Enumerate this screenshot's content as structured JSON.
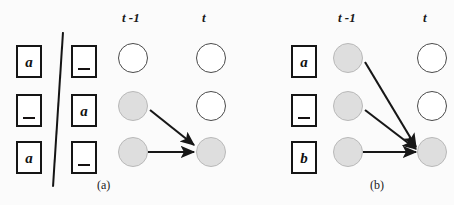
{
  "figure": {
    "type": "diagram",
    "panels": [
      {
        "id": "a",
        "caption": "(a)",
        "column_headers": {
          "previous": "t -1",
          "current": "t"
        },
        "tape": {
          "left_column": [
            {
              "glyph": "a",
              "blank": false
            },
            {
              "glyph": "",
              "blank": true
            },
            {
              "glyph": "a",
              "blank": false
            }
          ],
          "right_column": [
            {
              "glyph": "",
              "blank": true
            },
            {
              "glyph": "a",
              "blank": false
            },
            {
              "glyph": "",
              "blank": true
            }
          ],
          "divider": "slanted-line"
        },
        "nodes": {
          "previous_column": [
            {
              "row": 1,
              "state": "empty"
            },
            {
              "row": 2,
              "state": "filled"
            },
            {
              "row": 3,
              "state": "filled"
            }
          ],
          "current_column": [
            {
              "row": 1,
              "state": "empty"
            },
            {
              "row": 2,
              "state": "empty"
            },
            {
              "row": 3,
              "state": "filled"
            }
          ]
        },
        "edges": [
          {
            "from_row": 2,
            "to_row": 3
          },
          {
            "from_row": 3,
            "to_row": 3
          }
        ]
      },
      {
        "id": "b",
        "caption": "(b)",
        "column_headers": {
          "previous": "t -1",
          "current": "t"
        },
        "tape": {
          "left_column": [
            {
              "glyph": "a",
              "blank": false
            },
            {
              "glyph": "",
              "blank": true
            },
            {
              "glyph": "b",
              "blank": false
            }
          ],
          "right_column": [],
          "divider": "none"
        },
        "nodes": {
          "previous_column": [
            {
              "row": 1,
              "state": "filled"
            },
            {
              "row": 2,
              "state": "filled"
            },
            {
              "row": 3,
              "state": "filled"
            }
          ],
          "current_column": [
            {
              "row": 1,
              "state": "empty"
            },
            {
              "row": 2,
              "state": "empty"
            },
            {
              "row": 3,
              "state": "filled"
            }
          ]
        },
        "edges": [
          {
            "from_row": 1,
            "to_row": 3
          },
          {
            "from_row": 2,
            "to_row": 3
          },
          {
            "from_row": 3,
            "to_row": 3
          }
        ]
      }
    ],
    "colors": {
      "node_filled": "#dedede",
      "node_filled_border": "#b9b9b9",
      "node_empty_border": "#4a4a4a",
      "ink": "#151515",
      "page": "#ffffff"
    }
  }
}
